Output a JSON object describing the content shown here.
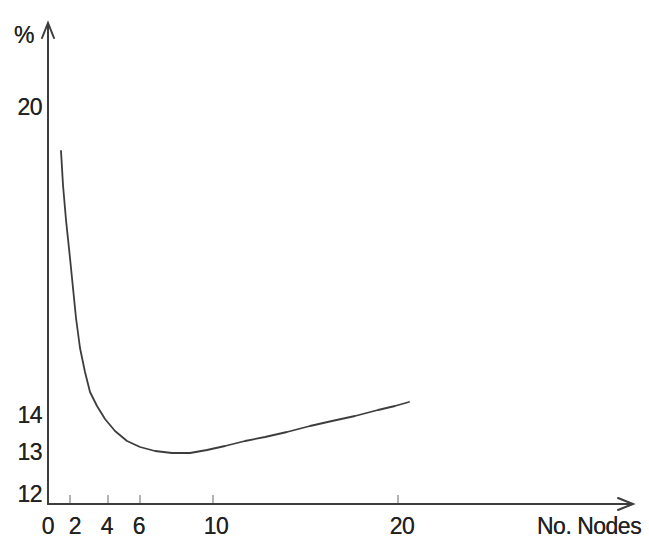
{
  "chart_data": {
    "type": "line",
    "title": "",
    "xlabel": "No. Nodes",
    "ylabel": "%",
    "x": [
      1.5,
      2,
      2.5,
      3,
      3.5,
      4,
      5,
      6,
      7,
      8,
      9,
      10,
      12,
      14,
      16,
      18,
      20,
      20.5
    ],
    "series": [
      {
        "name": "percentage-vs-nodes",
        "values": [
          19.1,
          17.5,
          16.0,
          15.0,
          14.4,
          13.9,
          13.4,
          13.15,
          13.05,
          13.0,
          13.05,
          13.1,
          13.3,
          13.5,
          13.75,
          13.95,
          14.2,
          14.3
        ]
      }
    ],
    "x_axis_ticks": [
      0,
      2,
      4,
      6,
      10,
      20
    ],
    "y_axis_ticks": [
      12,
      13,
      14,
      20
    ],
    "xlim": [
      0,
      32
    ],
    "ylim": [
      12,
      21
    ],
    "grid": false,
    "legend": "none",
    "annotations": []
  },
  "render": {
    "colors": {
      "axis": "#3d3d3d",
      "curve": "#3d3d3d",
      "tick_mark": "#9a9a9a",
      "text": "#222222",
      "background": "#ffffff"
    },
    "y_axis": {
      "x": 48,
      "y_top": 24,
      "y_bottom": 505
    },
    "x_axis": {
      "y": 504,
      "x_left": 48,
      "x_right": 632
    },
    "x_tick_marks_px": [
      70,
      108,
      140,
      213,
      398
    ],
    "x_tick_labels": [
      {
        "label": "0",
        "x": 48
      },
      {
        "label": "2",
        "x": 75
      },
      {
        "label": "4",
        "x": 107
      },
      {
        "label": "6",
        "x": 139
      },
      {
        "label": "10",
        "x": 216
      },
      {
        "label": "20",
        "x": 402
      }
    ],
    "y_tick_labels": [
      {
        "label": "20",
        "y": 107
      },
      {
        "label": "14",
        "y": 415
      },
      {
        "label": "13",
        "y": 452
      },
      {
        "label": "12",
        "y": 494
      }
    ],
    "curve_px": [
      [
        61,
        151
      ],
      [
        63,
        185
      ],
      [
        66,
        220
      ],
      [
        70,
        258
      ],
      [
        73,
        288
      ],
      [
        76,
        318
      ],
      [
        80,
        348
      ],
      [
        85,
        372
      ],
      [
        90,
        392
      ],
      [
        97,
        406
      ],
      [
        105,
        419
      ],
      [
        115,
        431
      ],
      [
        127,
        441
      ],
      [
        140,
        447
      ],
      [
        155,
        451
      ],
      [
        172,
        453
      ],
      [
        190,
        453
      ],
      [
        207,
        450
      ],
      [
        225,
        446
      ],
      [
        245,
        441
      ],
      [
        265,
        437
      ],
      [
        287,
        432
      ],
      [
        310,
        426
      ],
      [
        332,
        421
      ],
      [
        355,
        416
      ],
      [
        378,
        410
      ],
      [
        395,
        406
      ],
      [
        409,
        402
      ]
    ]
  }
}
